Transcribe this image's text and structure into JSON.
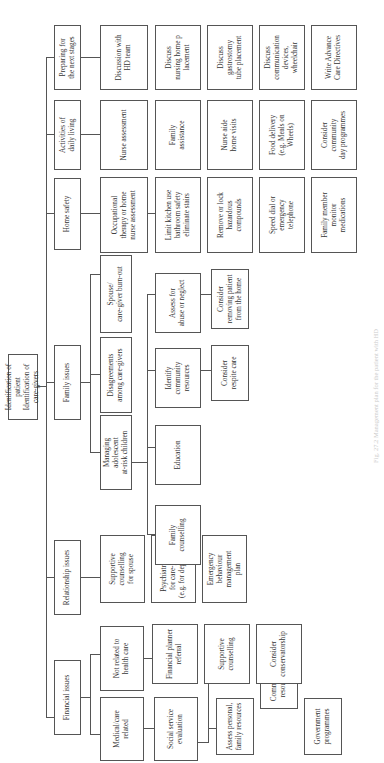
{
  "root": {
    "label": "Identification of patient\nIdentification of care-givers"
  },
  "categories": [
    {
      "label": "Financial issues"
    },
    {
      "label": "Relationship issues"
    },
    {
      "label": "Family issues"
    },
    {
      "label": "Home safety"
    },
    {
      "label": "Activities of\ndaily living"
    },
    {
      "label": "Preparing for\nthe next stages"
    }
  ],
  "financial": {
    "medicalcare": "Medical/care related",
    "social_service": "Social service\nevaluation",
    "assess": "Assess personal,\nfamily resources",
    "community": "Community\nresources",
    "government": "Government\nprogrammes",
    "not_related": "Not related to\nhealth care",
    "planner": "Financial planner\nreferral",
    "supportive": "Supportive\ncounselling",
    "conservatorship": "Consider\nconservatorship"
  },
  "relationship": {
    "supportive_spouse": "Supportive\ncounselling\nfor spouse",
    "psychiatric": "Psychiatric care\nfor care-givers\n(e.g. for depression)",
    "emergency": "Emergency\nbehaviour\nmanagement\nplan"
  },
  "family": {
    "managing": "Managing\nadolescent\nat-risk children",
    "disagreements": "Disagreements\namong care-givers",
    "burnout": "Spouse/\ncare-giver burn-out",
    "counselling": "Family counselling",
    "education": "Education",
    "identify": "Identify\ncommunity\nresources",
    "respite": "Consider\nrespite care",
    "abuse": "Assess for\nabuse or neglect",
    "removing": "Consider\nremoving patient\nfrom the home"
  },
  "home_safety": {
    "ot": "Occupational\ntherapy or home\nnurse assessment",
    "kitchen": "Limit kitchen use\nbathroom safety\neliminate stairs",
    "remove": "Remove or lock\nhazardous\ncompounds",
    "speed": "Speed dial or\nemergency\ntelephone",
    "family_member": "Family member\nmonitor\nmedications"
  },
  "adl": {
    "nurse": "Nurse assessment",
    "family": "Family\nassistance",
    "aide": "Nurse aide\nhome visits",
    "food": "Food delivery\n(e.g. Meals on\nWheels)",
    "day": "Consider\ncommunity\nday programmes"
  },
  "preparing": {
    "discussion": "Discussion with\nHD team",
    "nursing_home": "Discuss\nnursing home p\nlacement",
    "gastrostomy": "Discuss\ngastrostomy\ntube placement",
    "communication": "Discuss\ncommunication\ndevices,\nwheelchair",
    "advance": "Write Advance\nCare Directives"
  },
  "caption": "Fig. 27.2 Management plan for the patient with HD"
}
